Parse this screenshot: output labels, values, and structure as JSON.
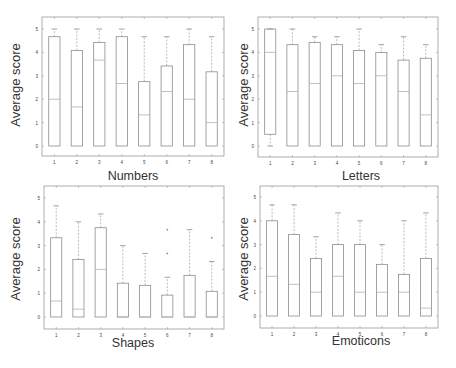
{
  "chart_data": [
    {
      "type": "boxplot",
      "title": "Numbers",
      "xlabel": "Numbers",
      "ylabel": "Average score",
      "categories": [
        "1",
        "2",
        "3",
        "4",
        "5",
        "6",
        "7",
        "8"
      ],
      "ylim": [
        0,
        5
      ],
      "yticks": [
        0,
        1,
        2,
        3,
        4,
        5
      ],
      "boxes": [
        {
          "q1": 0,
          "median": 2.0,
          "q3": 4.67,
          "whisker_low": 0,
          "whisker_high": 5.0,
          "outliers": []
        },
        {
          "q1": 0,
          "median": 1.67,
          "q3": 4.08,
          "whisker_low": 0,
          "whisker_high": 5.0,
          "outliers": []
        },
        {
          "q1": 0,
          "median": 3.67,
          "q3": 4.42,
          "whisker_low": 0,
          "whisker_high": 5.0,
          "outliers": []
        },
        {
          "q1": 0,
          "median": 2.67,
          "q3": 4.67,
          "whisker_low": 0,
          "whisker_high": 5.0,
          "outliers": []
        },
        {
          "q1": 0,
          "median": 1.33,
          "q3": 2.75,
          "whisker_low": 0,
          "whisker_high": 4.67,
          "outliers": []
        },
        {
          "q1": 0,
          "median": 2.33,
          "q3": 3.42,
          "whisker_low": 0,
          "whisker_high": 4.67,
          "outliers": []
        },
        {
          "q1": 0,
          "median": 2.0,
          "q3": 4.33,
          "whisker_low": 0,
          "whisker_high": 5.0,
          "outliers": []
        },
        {
          "q1": 0,
          "median": 1.0,
          "q3": 3.17,
          "whisker_low": 0,
          "whisker_high": 4.67,
          "outliers": []
        }
      ]
    },
    {
      "type": "boxplot",
      "title": "Letters",
      "xlabel": "Letters",
      "ylabel": "Average score",
      "categories": [
        "1",
        "2",
        "3",
        "4",
        "5",
        "6",
        "7",
        "8"
      ],
      "ylim": [
        0,
        5
      ],
      "yticks": [
        0,
        1,
        2,
        3,
        4,
        5
      ],
      "boxes": [
        {
          "q1": 0.5,
          "median": 4.0,
          "q3": 5.0,
          "whisker_low": 0,
          "whisker_high": 5.0,
          "outliers": []
        },
        {
          "q1": 0,
          "median": 2.33,
          "q3": 4.33,
          "whisker_low": 0,
          "whisker_high": 5.0,
          "outliers": []
        },
        {
          "q1": 0,
          "median": 2.67,
          "q3": 4.42,
          "whisker_low": 0,
          "whisker_high": 4.67,
          "outliers": []
        },
        {
          "q1": 0,
          "median": 3.0,
          "q3": 4.33,
          "whisker_low": 0,
          "whisker_high": 4.67,
          "outliers": []
        },
        {
          "q1": 0,
          "median": 2.67,
          "q3": 4.08,
          "whisker_low": 0,
          "whisker_high": 5.0,
          "outliers": []
        },
        {
          "q1": 0,
          "median": 3.0,
          "q3": 4.0,
          "whisker_low": 0,
          "whisker_high": 4.33,
          "outliers": []
        },
        {
          "q1": 0,
          "median": 2.33,
          "q3": 3.67,
          "whisker_low": 0,
          "whisker_high": 4.67,
          "outliers": []
        },
        {
          "q1": 0,
          "median": 1.33,
          "q3": 3.75,
          "whisker_low": 0,
          "whisker_high": 4.33,
          "outliers": []
        }
      ]
    },
    {
      "type": "boxplot",
      "title": "Shapes",
      "xlabel": "Shapes",
      "ylabel": "Average score",
      "categories": [
        "1",
        "2",
        "3",
        "4",
        "5",
        "6",
        "7",
        "8"
      ],
      "ylim": [
        0,
        5
      ],
      "yticks": [
        0,
        1,
        2,
        3,
        4,
        5
      ],
      "boxes": [
        {
          "q1": 0,
          "median": 0.67,
          "q3": 3.33,
          "whisker_low": 0,
          "whisker_high": 4.67,
          "outliers": []
        },
        {
          "q1": 0,
          "median": 0.33,
          "q3": 2.42,
          "whisker_low": 0,
          "whisker_high": 4.0,
          "outliers": []
        },
        {
          "q1": 0,
          "median": 2.0,
          "q3": 3.75,
          "whisker_low": 0,
          "whisker_high": 4.33,
          "outliers": []
        },
        {
          "q1": 0,
          "median": 0.0,
          "q3": 1.42,
          "whisker_low": 0,
          "whisker_high": 3.0,
          "outliers": []
        },
        {
          "q1": 0,
          "median": 0.0,
          "q3": 1.33,
          "whisker_low": 0,
          "whisker_high": 2.67,
          "outliers": []
        },
        {
          "q1": 0,
          "median": 0.0,
          "q3": 0.92,
          "whisker_low": 0,
          "whisker_high": 1.67,
          "outliers": [
            2.67,
            3.67
          ]
        },
        {
          "q1": 0,
          "median": 0.0,
          "q3": 1.75,
          "whisker_low": 0,
          "whisker_high": 3.67,
          "outliers": []
        },
        {
          "q1": 0,
          "median": 0.0,
          "q3": 1.08,
          "whisker_low": 0,
          "whisker_high": 2.33,
          "outliers": [
            3.33
          ]
        }
      ]
    },
    {
      "type": "boxplot",
      "title": "Emoticons",
      "xlabel": "Emoticons",
      "ylabel": "Average score",
      "categories": [
        "1",
        "2",
        "3",
        "4",
        "5",
        "6",
        "7",
        "8"
      ],
      "ylim": [
        0,
        5
      ],
      "yticks": [
        0,
        1,
        2,
        3,
        4,
        5
      ],
      "boxes": [
        {
          "q1": 0,
          "median": 1.67,
          "q3": 4.0,
          "whisker_low": 0,
          "whisker_high": 4.67,
          "outliers": []
        },
        {
          "q1": 0,
          "median": 1.33,
          "q3": 3.42,
          "whisker_low": 0,
          "whisker_high": 4.67,
          "outliers": []
        },
        {
          "q1": 0,
          "median": 1.0,
          "q3": 2.42,
          "whisker_low": 0,
          "whisker_high": 3.33,
          "outliers": []
        },
        {
          "q1": 0,
          "median": 1.67,
          "q3": 3.0,
          "whisker_low": 0,
          "whisker_high": 4.33,
          "outliers": []
        },
        {
          "q1": 0,
          "median": 1.0,
          "q3": 3.0,
          "whisker_low": 0,
          "whisker_high": 4.0,
          "outliers": []
        },
        {
          "q1": 0,
          "median": 1.0,
          "q3": 2.17,
          "whisker_low": 0,
          "whisker_high": 3.0,
          "outliers": []
        },
        {
          "q1": 0,
          "median": 1.0,
          "q3": 1.75,
          "whisker_low": 0,
          "whisker_high": 4.0,
          "outliers": []
        },
        {
          "q1": 0,
          "median": 0.33,
          "q3": 2.42,
          "whisker_low": 0,
          "whisker_high": 4.33,
          "outliers": []
        }
      ]
    }
  ],
  "panels": [
    {
      "title": "Numbers",
      "ylabel": "Average score"
    },
    {
      "title": "Letters",
      "ylabel": "Average score"
    },
    {
      "title": "Shapes",
      "ylabel": "Average score"
    },
    {
      "title": "Emoticons",
      "ylabel": "Average score"
    }
  ],
  "colors": {
    "frame": "#9a9a9a",
    "box": "#8c8c8c",
    "whisker": "#a0a0a0",
    "median": "#b0b0b0",
    "tick_text": "#444444",
    "label_text": "#333333"
  }
}
